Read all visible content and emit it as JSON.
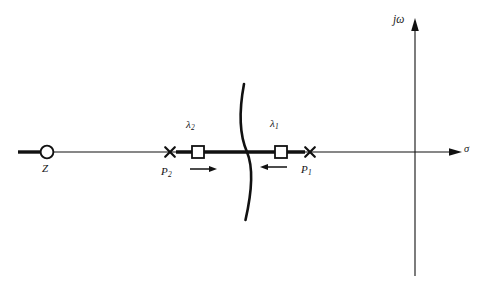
{
  "figure": {
    "kind": "root-locus-plot",
    "background_color": "#ffffff",
    "ink_color": "#111111",
    "width": 478,
    "height": 289
  },
  "axes": {
    "real_axis": {
      "name": "sigma-axis",
      "label": "σ",
      "y": 152,
      "x_start": 18,
      "x_end": 462,
      "arrow": "right",
      "label_x": 464,
      "label_y": 144
    },
    "imaginary_axis": {
      "name": "jomega-axis",
      "label": "jω",
      "x": 415,
      "y_start": 18,
      "y_end": 276,
      "arrow": "up",
      "label_x": 393,
      "label_y": 14
    },
    "origin": {
      "x": 415,
      "y": 152
    }
  },
  "markers": [
    {
      "name": "zero-z",
      "glyph": "circle",
      "label": "Z",
      "label_sub": "",
      "x": 47,
      "y": 152,
      "radius": 6.5,
      "label_x": 42,
      "label_y": 163
    },
    {
      "name": "pole-p2",
      "glyph": "cross",
      "label": "P",
      "label_sub": "2",
      "x": 170,
      "y": 152,
      "size": 6.5,
      "label_x": 161,
      "label_y": 166
    },
    {
      "name": "closed-loop-root-lambda2",
      "glyph": "square",
      "label": "λ",
      "label_sub": "2",
      "x": 198,
      "y": 152,
      "size": 12,
      "label_x": 186,
      "label_y": 119
    },
    {
      "name": "closed-loop-root-lambda1",
      "glyph": "square",
      "label": "λ",
      "label_sub": "1",
      "x": 281,
      "y": 152,
      "size": 12,
      "label_x": 270,
      "label_y": 118
    },
    {
      "name": "pole-p1",
      "glyph": "cross",
      "label": "P",
      "label_sub": "1",
      "x": 310,
      "y": 152,
      "size": 6.5,
      "label_x": 301,
      "label_y": 164
    }
  ],
  "locus_segments": [
    {
      "name": "locus-left-of-zero",
      "description": "thick real-axis branch extending left from the zero",
      "x_start": 18,
      "x_end": 41,
      "y": 152,
      "thickness": 3.4
    },
    {
      "name": "locus-between-poles",
      "description": "thick real-axis branch between P2 and P1 through lambda2 and lambda1",
      "x_start": 176,
      "x_end": 305,
      "y": 152,
      "thickness": 3.4
    },
    {
      "name": "locus-breakaway-curve",
      "description": "curved complex branch crossing the real axis between lambda2 and lambda1",
      "top_x": 244,
      "top_y": 84,
      "mid_x": 247,
      "mid_y": 152,
      "bottom_x": 245,
      "bottom_y": 220,
      "thickness": 2.6
    }
  ],
  "direction_arrows": [
    {
      "name": "arrow-lambda2-moving-right",
      "direction": "right",
      "x_start": 190,
      "x_end": 216,
      "y": 169
    },
    {
      "name": "arrow-lambda1-moving-left",
      "direction": "left",
      "x_start": 287,
      "x_end": 261,
      "y": 167
    }
  ],
  "labels": {
    "jomega": "jω",
    "sigma": "σ",
    "zero": "Z",
    "pole_2_base": "P",
    "pole_2_sub": "2",
    "pole_1_base": "P",
    "pole_1_sub": "1",
    "lambda_2_base": "λ",
    "lambda_2_sub": "2",
    "lambda_1_base": "λ",
    "lambda_1_sub": "1"
  }
}
